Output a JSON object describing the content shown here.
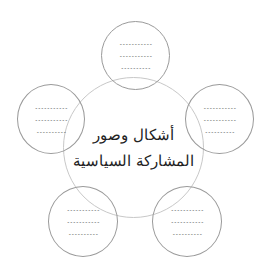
{
  "diagram": {
    "type": "mind-map",
    "center": {
      "title_line_1": "أشكال وصور",
      "title_line_2": "المشاركة السياسية"
    },
    "satellites": [
      {
        "position": "top",
        "lines": [
          "-----------",
          "-----------",
          "----------"
        ]
      },
      {
        "position": "right",
        "lines": [
          "-----------",
          "-----------",
          "----------"
        ]
      },
      {
        "position": "bottom-right",
        "lines": [
          "-----------",
          "-----------",
          "----------"
        ]
      },
      {
        "position": "bottom-left",
        "lines": [
          "-----------",
          "-----------",
          "----------"
        ]
      },
      {
        "position": "left",
        "lines": [
          "-----------",
          "-----------",
          "----------"
        ]
      }
    ],
    "colors": {
      "center_border": "#c8c8c8",
      "satellite_border": "#9a9a9a",
      "text": "#222222"
    }
  }
}
